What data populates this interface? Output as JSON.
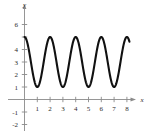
{
  "chart_data": {
    "type": "line",
    "title": "",
    "xlabel": "x",
    "ylabel": "y",
    "xlim": [
      -0.6,
      9.0
    ],
    "ylim": [
      -2.6,
      7.2
    ],
    "grid": false,
    "legend": null,
    "x_ticks": [
      1,
      2,
      3,
      4,
      5,
      6,
      7,
      8
    ],
    "x_tick_labels": [
      "1",
      "2",
      "3",
      "4",
      "5",
      "6",
      "7",
      "8"
    ],
    "y_ticks": [
      6,
      4,
      3,
      2,
      1,
      -1,
      -2
    ],
    "y_tick_labels": [
      "6",
      "4",
      "3",
      "2",
      "1",
      "-1",
      "-2"
    ],
    "series": [
      {
        "name": "cosine-wave",
        "description": "y = 3 + 2*cos(pi*x) sampled from x = 0 to x = 8.2",
        "amplitude": 2,
        "midline": 3,
        "period": 2,
        "ymin": 1,
        "ymax": 5,
        "x_start": 0,
        "x_end": 8.2,
        "peaks_x": [
          1.3,
          3.3,
          5.3,
          7.3
        ],
        "troughs_x": [
          0.45,
          2.4,
          4.4,
          6.4,
          8.2
        ],
        "peak_value": 5,
        "trough_value": 1
      }
    ]
  },
  "axis_labels": {
    "y_axis_name": "y",
    "x_axis_name": "x"
  },
  "colors": {
    "curve": "#111111",
    "axis": "#8a8a8a",
    "text": "#2b2b2b",
    "background": "#ffffff"
  }
}
